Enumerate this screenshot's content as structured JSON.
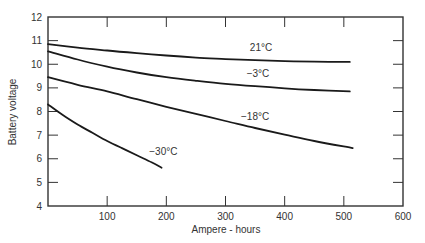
{
  "chart_data": {
    "type": "line",
    "title": "",
    "xlabel": "Ampere - hours",
    "ylabel": "Battery voltage",
    "xlim": [
      0,
      600
    ],
    "ylim": [
      4,
      12
    ],
    "xticks": [
      100,
      200,
      300,
      400,
      500,
      600
    ],
    "yticks": [
      4,
      5,
      6,
      7,
      8,
      9,
      10,
      11,
      12
    ],
    "grid": false,
    "legend": "inline labels on curves",
    "series": [
      {
        "name": "21°C",
        "label_pos": [
          360,
          10.55
        ],
        "x": [
          0,
          50,
          100,
          150,
          200,
          250,
          300,
          350,
          400,
          450,
          510
        ],
        "y": [
          10.85,
          10.7,
          10.58,
          10.47,
          10.37,
          10.28,
          10.22,
          10.17,
          10.13,
          10.11,
          10.1
        ]
      },
      {
        "name": "−3°C",
        "label_pos": [
          355,
          9.45
        ],
        "x": [
          0,
          50,
          100,
          150,
          200,
          250,
          300,
          350,
          400,
          450,
          510
        ],
        "y": [
          10.55,
          10.2,
          9.9,
          9.65,
          9.45,
          9.3,
          9.17,
          9.07,
          8.98,
          8.91,
          8.85
        ]
      },
      {
        "name": "−18°C",
        "label_pos": [
          350,
          7.65
        ],
        "x": [
          0,
          50,
          100,
          150,
          200,
          250,
          300,
          350,
          400,
          450,
          515
        ],
        "y": [
          9.45,
          9.13,
          8.85,
          8.52,
          8.2,
          7.9,
          7.6,
          7.3,
          7.02,
          6.75,
          6.45
        ]
      },
      {
        "name": "−30°C",
        "label_pos": [
          195,
          6.15
        ],
        "x": [
          0,
          25,
          50,
          75,
          100,
          125,
          150,
          175,
          192
        ],
        "y": [
          8.3,
          7.85,
          7.45,
          7.1,
          6.75,
          6.45,
          6.15,
          5.85,
          5.62
        ]
      }
    ]
  },
  "colors": {
    "line": "#1a1a1a",
    "axis": "#333333",
    "text": "#333333",
    "background": "#ffffff"
  }
}
